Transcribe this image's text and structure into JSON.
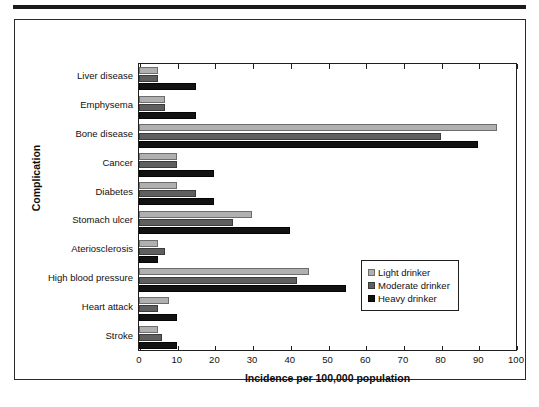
{
  "chart_data": {
    "type": "bar",
    "orientation": "horizontal",
    "title": "",
    "xlabel": "Incidence per 100,000 population",
    "ylabel": "Complication",
    "xlim": [
      0,
      100
    ],
    "xticks": [
      0,
      10,
      20,
      30,
      40,
      50,
      60,
      70,
      80,
      90,
      100
    ],
    "grid": false,
    "legend_position": "inside-right",
    "categories": [
      "Liver disease",
      "Emphysema",
      "Bone disease",
      "Cancer",
      "Diabetes",
      "Stomach ulcer",
      "Ateriosclerosis",
      "High blood pressure",
      "Heart attack",
      "Stroke"
    ],
    "series": [
      {
        "name": "Light drinker",
        "color": "#b0b0b0",
        "values": [
          5,
          7,
          95,
          10,
          10,
          30,
          5,
          45,
          8,
          5
        ]
      },
      {
        "name": "Moderate drinker",
        "color": "#5f5f5f",
        "values": [
          5,
          7,
          80,
          10,
          15,
          25,
          7,
          42,
          5,
          6
        ]
      },
      {
        "name": "Heavy drinker",
        "color": "#121212",
        "values": [
          15,
          15,
          90,
          20,
          20,
          40,
          5,
          55,
          10,
          10
        ]
      }
    ]
  },
  "legend": {
    "entries": [
      {
        "label": "Light drinker",
        "swatch": "s0"
      },
      {
        "label": "Moderate drinker",
        "swatch": "s1"
      },
      {
        "label": "Heavy drinker",
        "swatch": "s2"
      }
    ]
  }
}
